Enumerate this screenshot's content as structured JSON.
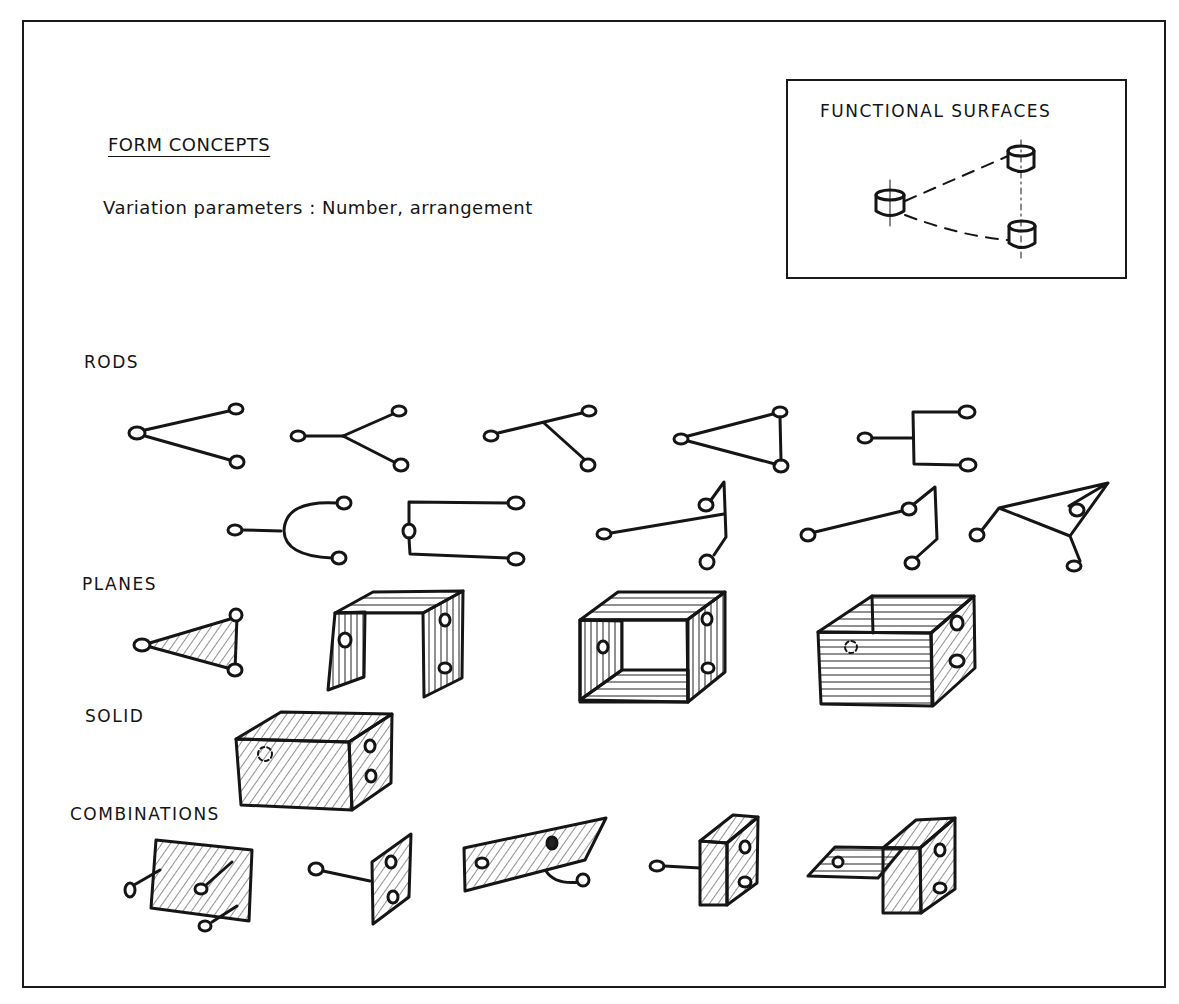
{
  "title": "FORM CONCEPTS",
  "subtitle": "Variation parameters : Number, arrangement",
  "functional_surfaces": {
    "label": "FUNCTIONAL SURFACES",
    "elements": [
      "cylinder-left",
      "cylinder-top-right",
      "cylinder-bottom-right"
    ]
  },
  "sections": [
    {
      "label": "RODS",
      "variants": 10
    },
    {
      "label": "PLANES",
      "variants": 4
    },
    {
      "label": "SOLID",
      "variants": 1
    },
    {
      "label": "COMBINATIONS",
      "variants": 5
    }
  ],
  "colors": {
    "ink": "#151515",
    "paper": "#ffffff"
  }
}
